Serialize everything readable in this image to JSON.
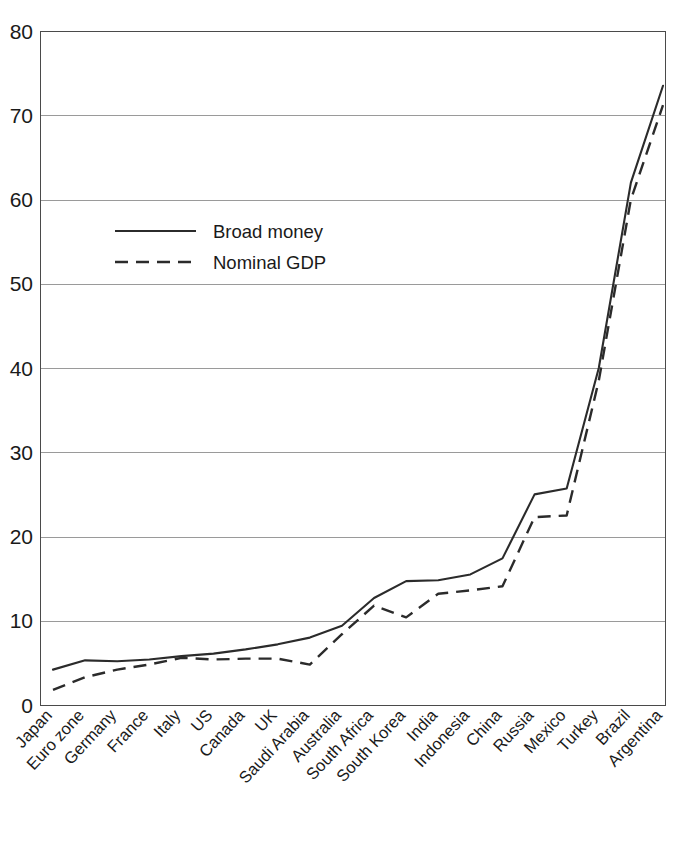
{
  "chart_data": {
    "type": "line",
    "title": "",
    "subtitle": "",
    "xlabel": "",
    "ylabel": "",
    "ylim": [
      0,
      80
    ],
    "yticks": [
      0,
      10,
      20,
      30,
      40,
      50,
      60,
      70,
      80
    ],
    "ytick_labels": [
      "0",
      "10",
      "20",
      "30",
      "40",
      "50",
      "60",
      "70",
      "80"
    ],
    "grid": true,
    "legend_position": "upper-left-inside",
    "categories": [
      "Japan",
      "Euro zone",
      "Germany",
      "France",
      "Italy",
      "US",
      "Canada",
      "UK",
      "Saudi Arabia",
      "Australia",
      "South Africa",
      "South Korea",
      "India",
      "Indonesia",
      "China",
      "Russia",
      "Mexico",
      "Turkey",
      "Brazil",
      "Argentina"
    ],
    "series": [
      {
        "name": "Broad money",
        "style": "solid",
        "color": "#2b2b2b",
        "values": [
          4.2,
          5.3,
          5.2,
          5.4,
          5.8,
          6.1,
          6.6,
          7.2,
          8.0,
          9.4,
          12.7,
          14.7,
          14.8,
          15.5,
          17.4,
          25.0,
          25.7,
          40.0,
          62.0,
          73.5
        ]
      },
      {
        "name": "Nominal GDP",
        "style": "dashed",
        "color": "#2b2b2b",
        "values": [
          1.8,
          3.3,
          4.2,
          4.8,
          5.6,
          5.4,
          5.5,
          5.5,
          4.8,
          8.4,
          11.8,
          10.4,
          13.2,
          13.6,
          14.1,
          22.3,
          22.5,
          38.5,
          60.0,
          71.2
        ]
      }
    ]
  },
  "legend": {
    "entries": [
      {
        "label": "Broad money",
        "style": "solid"
      },
      {
        "label": "Nominal GDP",
        "style": "dashed"
      }
    ]
  },
  "colors": {
    "line": "#2b2b2b",
    "grid": "#9a9a9a",
    "axis": "#4a4a4a",
    "background": "#ffffff",
    "text": "#1a1a1a"
  }
}
